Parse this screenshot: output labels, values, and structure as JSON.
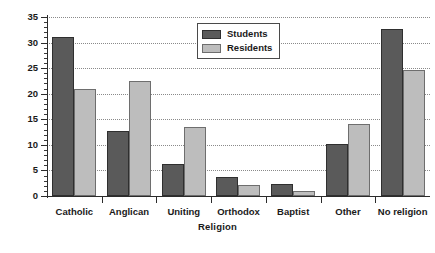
{
  "chart_data": {
    "type": "bar",
    "title": "",
    "xlabel": "Religion",
    "ylabel": "Percentages",
    "categories": [
      "Catholic",
      "Anglican",
      "Uniting",
      "Orthodox",
      "Baptist",
      "Other",
      "No religion"
    ],
    "series": [
      {
        "name": "Students",
        "color": "#5a5a5a",
        "values": [
          31.1,
          12.8,
          6.3,
          3.7,
          2.4,
          10.1,
          32.6
        ]
      },
      {
        "name": "Residents",
        "color": "#bdbdbd",
        "values": [
          21.0,
          22.5,
          13.5,
          2.1,
          1.0,
          14.0,
          24.7
        ]
      }
    ],
    "ylim": [
      0,
      35
    ],
    "ytick_labels": [
      "0",
      "5",
      "10",
      "15",
      "20",
      "25",
      "30",
      "35"
    ],
    "ytick_values": [
      0,
      5,
      10,
      15,
      20,
      25,
      30,
      35
    ],
    "ytick_minor_step": 1,
    "grid": "horizontal-dotted",
    "legend_position": "upper-center",
    "legend_entries": [
      "Students",
      "Residents"
    ]
  }
}
